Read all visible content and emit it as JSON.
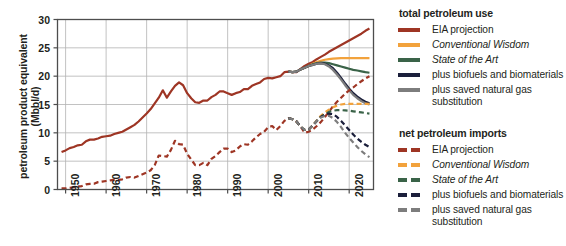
{
  "chart_data": {
    "type": "line",
    "title": "",
    "xlabel": "",
    "ylabel": "petroleum product equivalent (Mbbl/d)",
    "ylabel_line1": "petroleum product equivalent",
    "ylabel_line2": "(Mbbl/d)",
    "xlim": [
      1948,
      2026
    ],
    "ylim": [
      0,
      30
    ],
    "yticks": [
      0,
      5,
      10,
      15,
      20,
      25,
      30
    ],
    "xticks": [
      1950,
      1960,
      1970,
      1980,
      1990,
      2000,
      2010,
      2020
    ],
    "xtick_labels": [
      "1950",
      "1960",
      "1970",
      "1980",
      "1990",
      "2000",
      "2010",
      "2020"
    ],
    "ytick_labels": [
      "0",
      "5",
      "10",
      "15",
      "20",
      "25",
      "30"
    ],
    "grid": true,
    "legend_position": "right",
    "colors": {
      "eia": "#9e3524",
      "conventional_wisdom": "#f2a23c",
      "state_of_the_art": "#3a6348",
      "biofuels": "#1b1f3b",
      "saved_gas": "#7d7d7d"
    },
    "series": [
      {
        "name": "total petroleum use — EIA projection",
        "group": "total petroleum use",
        "style": "solid",
        "color": "#9e3524",
        "x": [
          1949,
          1950,
          1951,
          1952,
          1953,
          1954,
          1955,
          1956,
          1957,
          1958,
          1959,
          1960,
          1961,
          1962,
          1963,
          1964,
          1965,
          1966,
          1967,
          1968,
          1969,
          1970,
          1971,
          1972,
          1973,
          1974,
          1975,
          1976,
          1977,
          1978,
          1979,
          1980,
          1981,
          1982,
          1983,
          1984,
          1985,
          1986,
          1987,
          1988,
          1989,
          1990,
          1991,
          1992,
          1993,
          1994,
          1995,
          1996,
          1997,
          1998,
          1999,
          2000,
          2001,
          2002,
          2003,
          2004,
          2005,
          2006,
          2007,
          2008,
          2009,
          2010,
          2011,
          2012,
          2013,
          2014,
          2015,
          2016,
          2017,
          2018,
          2019,
          2020,
          2021,
          2022,
          2023,
          2024,
          2025
        ],
        "y": [
          6.6,
          6.9,
          7.3,
          7.5,
          7.8,
          7.9,
          8.5,
          8.8,
          8.8,
          9.0,
          9.3,
          9.4,
          9.5,
          9.8,
          10.0,
          10.2,
          10.6,
          11.0,
          11.4,
          12.0,
          12.7,
          13.4,
          14.2,
          15.2,
          16.2,
          17.5,
          16.2,
          17.3,
          18.3,
          18.9,
          18.4,
          17.0,
          16.1,
          15.4,
          15.3,
          15.7,
          15.7,
          16.3,
          16.7,
          17.3,
          17.3,
          17.0,
          16.7,
          17.0,
          17.2,
          17.7,
          17.7,
          18.3,
          18.6,
          18.9,
          19.5,
          19.7,
          19.6,
          19.8,
          20.0,
          20.7,
          20.8,
          20.7,
          20.7,
          21.3,
          21.8,
          22.2,
          22.5,
          23.0,
          23.4,
          23.8,
          24.3,
          24.7,
          25.1,
          25.5,
          25.9,
          26.3,
          26.7,
          27.1,
          27.5,
          28.0,
          28.4
        ]
      },
      {
        "name": "total petroleum use — Conventional Wisdom",
        "group": "total petroleum use",
        "style": "solid",
        "color": "#f2a23c",
        "x": [
          2005,
          2006,
          2007,
          2008,
          2009,
          2010,
          2011,
          2012,
          2013,
          2014,
          2015,
          2016,
          2017,
          2018,
          2019,
          2020,
          2021,
          2022,
          2023,
          2024,
          2025
        ],
        "y": [
          20.8,
          20.7,
          20.8,
          21.2,
          21.5,
          21.8,
          22.2,
          22.5,
          22.7,
          22.9,
          23.0,
          23.1,
          23.15,
          23.2,
          23.2,
          23.2,
          23.2,
          23.2,
          23.2,
          23.2,
          23.2
        ]
      },
      {
        "name": "total petroleum use — State of the Art",
        "group": "total petroleum use",
        "style": "solid",
        "color": "#3a6348",
        "x": [
          2005,
          2006,
          2007,
          2008,
          2009,
          2010,
          2011,
          2012,
          2013,
          2014,
          2015,
          2016,
          2017,
          2018,
          2019,
          2020,
          2021,
          2022,
          2023,
          2024,
          2025
        ],
        "y": [
          20.8,
          20.7,
          20.8,
          21.2,
          21.5,
          21.8,
          22.1,
          22.3,
          22.4,
          22.4,
          22.3,
          22.1,
          21.9,
          21.7,
          21.5,
          21.3,
          21.1,
          21.0,
          20.85,
          20.7,
          20.6
        ]
      },
      {
        "name": "total petroleum use — plus biofuels and biomaterials",
        "group": "total petroleum use",
        "style": "solid",
        "color": "#1b1f3b",
        "x": [
          2005,
          2006,
          2007,
          2008,
          2009,
          2010,
          2011,
          2012,
          2013,
          2014,
          2015,
          2016,
          2017,
          2018,
          2019,
          2020,
          2021,
          2022,
          2023,
          2024,
          2025
        ],
        "y": [
          20.8,
          20.7,
          20.8,
          21.2,
          21.5,
          21.8,
          22.0,
          22.2,
          22.3,
          22.2,
          21.9,
          21.4,
          20.6,
          19.7,
          18.7,
          17.8,
          17.0,
          16.4,
          15.9,
          15.5,
          15.2
        ]
      },
      {
        "name": "total petroleum use — plus saved natural gas substitution",
        "group": "total petroleum use",
        "style": "solid",
        "color": "#7d7d7d",
        "x": [
          2005,
          2006,
          2007,
          2008,
          2009,
          2010,
          2011,
          2012,
          2013,
          2014,
          2015,
          2016,
          2017,
          2018,
          2019,
          2020,
          2021,
          2022,
          2023,
          2024,
          2025
        ],
        "y": [
          20.8,
          20.7,
          20.8,
          21.2,
          21.5,
          21.8,
          22.0,
          22.2,
          22.25,
          22.1,
          21.7,
          21.1,
          20.3,
          19.4,
          18.4,
          17.5,
          16.7,
          16.1,
          15.6,
          15.2,
          15.0
        ]
      },
      {
        "name": "net petroleum imports — EIA projection",
        "group": "net petroleum imports",
        "style": "dashed",
        "color": "#9e3524",
        "x": [
          1949,
          1950,
          1951,
          1952,
          1953,
          1954,
          1955,
          1956,
          1957,
          1958,
          1959,
          1960,
          1961,
          1962,
          1963,
          1964,
          1965,
          1966,
          1967,
          1968,
          1969,
          1970,
          1971,
          1972,
          1973,
          1974,
          1975,
          1976,
          1977,
          1978,
          1979,
          1980,
          1981,
          1982,
          1983,
          1984,
          1985,
          1986,
          1987,
          1988,
          1989,
          1990,
          1991,
          1992,
          1993,
          1994,
          1995,
          1996,
          1997,
          1998,
          1999,
          2000,
          2001,
          2002,
          2003,
          2004,
          2005,
          2006,
          2007,
          2008,
          2009,
          2010,
          2011,
          2012,
          2013,
          2014,
          2015,
          2016,
          2017,
          2018,
          2019,
          2020,
          2021,
          2022,
          2023,
          2024,
          2025
        ],
        "y": [
          0.2,
          0.2,
          0.3,
          0.4,
          0.5,
          0.6,
          0.9,
          1.0,
          1.0,
          1.3,
          1.4,
          1.5,
          1.6,
          1.7,
          1.7,
          1.8,
          2.1,
          2.2,
          2.1,
          2.4,
          2.7,
          3.0,
          3.4,
          4.3,
          6.0,
          5.9,
          5.8,
          7.0,
          8.6,
          8.0,
          7.9,
          6.3,
          5.3,
          4.3,
          4.3,
          4.7,
          4.3,
          5.4,
          5.9,
          6.6,
          7.2,
          7.2,
          6.6,
          6.9,
          7.6,
          8.0,
          7.9,
          8.5,
          9.2,
          9.8,
          10.2,
          11.0,
          11.2,
          10.5,
          11.2,
          12.1,
          12.6,
          12.4,
          12.0,
          11.1,
          10.0,
          10.2,
          10.6,
          11.2,
          11.9,
          12.8,
          13.7,
          14.7,
          15.5,
          16.2,
          16.9,
          17.5,
          18.0,
          18.6,
          19.1,
          19.6,
          20.0
        ]
      },
      {
        "name": "net petroleum imports — Conventional Wisdom",
        "group": "net petroleum imports",
        "style": "dashed",
        "color": "#f2a23c",
        "x": [
          2005,
          2006,
          2007,
          2008,
          2009,
          2010,
          2011,
          2012,
          2013,
          2014,
          2015,
          2016,
          2017,
          2018,
          2019,
          2020,
          2021,
          2022,
          2023,
          2024,
          2025
        ],
        "y": [
          12.6,
          12.4,
          12.0,
          11.1,
          10.5,
          10.6,
          11.3,
          12.2,
          13.0,
          13.6,
          14.1,
          14.5,
          14.8,
          15.0,
          15.1,
          15.1,
          15.1,
          15.1,
          15.1,
          15.1,
          15.1
        ]
      },
      {
        "name": "net petroleum imports — State of the Art",
        "group": "net petroleum imports",
        "style": "dashed",
        "color": "#3a6348",
        "x": [
          2005,
          2006,
          2007,
          2008,
          2009,
          2010,
          2011,
          2012,
          2013,
          2014,
          2015,
          2016,
          2017,
          2018,
          2019,
          2020,
          2021,
          2022,
          2023,
          2024,
          2025
        ],
        "y": [
          12.6,
          12.4,
          12.0,
          11.1,
          10.5,
          10.6,
          11.3,
          12.1,
          12.8,
          13.3,
          13.7,
          13.9,
          14.0,
          14.0,
          13.95,
          13.9,
          13.8,
          13.7,
          13.6,
          13.5,
          13.4
        ]
      },
      {
        "name": "net petroleum imports — plus biofuels and biomaterials",
        "group": "net petroleum imports",
        "style": "dashed",
        "color": "#1b1f3b",
        "x": [
          2005,
          2006,
          2007,
          2008,
          2009,
          2010,
          2011,
          2012,
          2013,
          2014,
          2015,
          2016,
          2017,
          2018,
          2019,
          2020,
          2021,
          2022,
          2023,
          2024,
          2025
        ],
        "y": [
          12.6,
          12.4,
          12.0,
          11.1,
          10.5,
          10.6,
          11.3,
          12.1,
          12.8,
          13.2,
          13.4,
          13.3,
          12.8,
          12.1,
          11.3,
          10.5,
          9.7,
          9.0,
          8.4,
          7.9,
          7.5
        ]
      },
      {
        "name": "net petroleum imports — plus saved natural gas substitution",
        "group": "net petroleum imports",
        "style": "dashed",
        "color": "#7d7d7d",
        "x": [
          2005,
          2006,
          2007,
          2008,
          2009,
          2010,
          2011,
          2012,
          2013,
          2014,
          2015,
          2016,
          2017,
          2018,
          2019,
          2020,
          2021,
          2022,
          2023,
          2024,
          2025
        ],
        "y": [
          12.6,
          12.4,
          12.0,
          11.1,
          10.5,
          10.6,
          11.3,
          12.1,
          12.7,
          13.0,
          13.0,
          12.6,
          11.9,
          11.0,
          10.0,
          9.1,
          8.3,
          7.5,
          6.8,
          6.2,
          5.7
        ]
      }
    ]
  },
  "legend": {
    "groups": [
      {
        "title": "total petroleum use",
        "style": "solid",
        "items": [
          {
            "label": "EIA projection",
            "color": "#9e3524",
            "italic": false
          },
          {
            "label": "Conventional Wisdom",
            "color": "#f2a23c",
            "italic": true
          },
          {
            "label": "State of the Art",
            "color": "#3a6348",
            "italic": true
          },
          {
            "label": "plus biofuels and biomaterials",
            "color": "#1b1f3b",
            "italic": false
          },
          {
            "label": "plus saved natural gas substitution",
            "color": "#7d7d7d",
            "italic": false
          }
        ]
      },
      {
        "title": "net petroleum imports",
        "style": "dashed",
        "items": [
          {
            "label": "EIA projection",
            "color": "#9e3524",
            "italic": false
          },
          {
            "label": "Conventional Wisdom",
            "color": "#f2a23c",
            "italic": true
          },
          {
            "label": "State of the Art",
            "color": "#3a6348",
            "italic": true
          },
          {
            "label": "plus biofuels and biomaterials",
            "color": "#1b1f3b",
            "italic": false
          },
          {
            "label": "plus saved natural gas substitution",
            "color": "#7d7d7d",
            "italic": false
          }
        ]
      }
    ]
  }
}
